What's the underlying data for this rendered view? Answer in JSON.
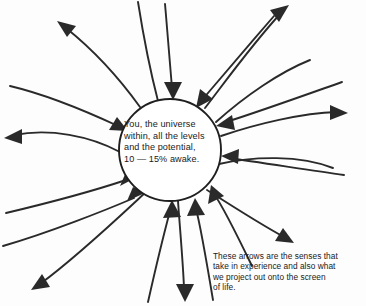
{
  "diagram": {
    "center_circle": {
      "lines": [
        "You, the universe",
        "within, all the levels",
        "and the potential,",
        "10 — 15% awake."
      ],
      "full_text": "You, the universe within, all the levels and the potential, 10 — 15% awake."
    },
    "caption": {
      "lines": [
        "These arrows are the senses that",
        "take in experience and also what",
        "we project out onto the screen",
        "of life."
      ],
      "full_text": "These arrows are the senses that take in experience and also what we project out onto the screen of life."
    },
    "colors": {
      "ink": "#2a2a2a",
      "outline": "#1f1f1f",
      "background": "#fdfdfd",
      "text": "#1a1a1a"
    },
    "arrows": {
      "outward_count": 10,
      "inward_count": 10,
      "description": "Curved arrows radiating from a central circle; each direction has one arrow pointing outward and one pointing inward toward the circle."
    }
  }
}
